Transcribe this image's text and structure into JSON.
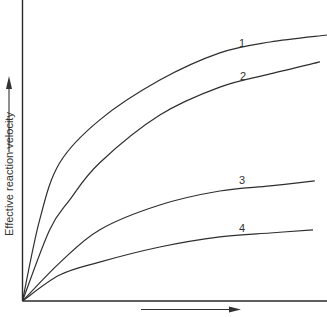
{
  "chart_data": {
    "type": "line",
    "title": "",
    "xlabel": "",
    "ylabel": "Effective reaction velocity",
    "x_axis_arrow": true,
    "y_axis_arrow": true,
    "grid": false,
    "legend": "inline curve labels",
    "xlim": [
      0,
      10
    ],
    "ylim": [
      0,
      10
    ],
    "series": [
      {
        "name": "1",
        "x": [
          0,
          0.56,
          1.22,
          2.53,
          4.51,
          6.48,
          8.13,
          10.0
        ],
        "values": [
          0,
          2.89,
          4.93,
          6.46,
          7.89,
          8.86,
          9.25,
          9.5
        ]
      },
      {
        "name": "2",
        "x": [
          0,
          0.89,
          1.55,
          2.53,
          4.51,
          6.48,
          8.13,
          9.77
        ],
        "values": [
          0,
          2.54,
          3.61,
          4.93,
          6.64,
          7.64,
          8.11,
          8.54
        ]
      },
      {
        "name": "3",
        "x": [
          0,
          1.22,
          2.53,
          4.51,
          6.48,
          8.13,
          9.6
        ],
        "values": [
          0,
          1.36,
          2.54,
          3.43,
          3.93,
          4.11,
          4.29
        ]
      },
      {
        "name": "4",
        "x": [
          0,
          1.22,
          2.53,
          4.51,
          6.48,
          8.13,
          9.54
        ],
        "values": [
          0,
          0.93,
          1.39,
          1.93,
          2.29,
          2.43,
          2.54
        ]
      }
    ],
    "annotations": [
      {
        "text": "1",
        "x": 6.8,
        "y": 9.3
      },
      {
        "text": "2",
        "x": 6.9,
        "y": 8.1
      },
      {
        "text": "3",
        "x": 7.5,
        "y": 4.4
      },
      {
        "text": "4",
        "x": 7.5,
        "y": 2.65
      }
    ]
  },
  "labels": {
    "ylabel": "Effective reaction velocity",
    "curve1": "1",
    "curve2": "2",
    "curve3": "3",
    "curve4": "4"
  }
}
